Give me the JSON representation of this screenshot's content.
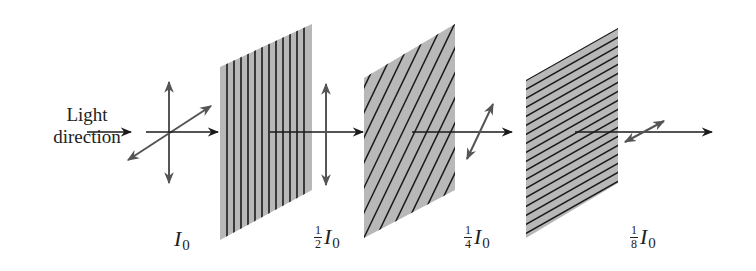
{
  "diagram": {
    "light_label": [
      "Light",
      "direction"
    ],
    "colors": {
      "polarizer_fill": "#b8b8b8",
      "stripe": "#1a1a1a",
      "ray": "#1a1a1a",
      "polarization_arrow": "#555555"
    },
    "intensity_labels": [
      {
        "coef_num": "",
        "coef_den": "",
        "symbol": "I",
        "subscript": "0"
      },
      {
        "coef_num": "1",
        "coef_den": "2",
        "symbol": "I",
        "subscript": "0"
      },
      {
        "coef_num": "1",
        "coef_den": "4",
        "symbol": "I",
        "subscript": "0"
      },
      {
        "coef_num": "1",
        "coef_den": "8",
        "symbol": "I",
        "subscript": "0"
      }
    ],
    "polarizers": [
      {
        "orientation": "vertical",
        "stripes": 13
      },
      {
        "orientation": "diagonal",
        "stripes": 14
      },
      {
        "orientation": "horizontal",
        "stripes": 18
      }
    ]
  }
}
